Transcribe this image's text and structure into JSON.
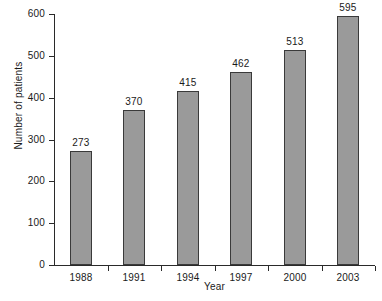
{
  "chart_data": {
    "type": "bar",
    "title": "",
    "xlabel": "Year",
    "ylabel": "Number of patients",
    "categories": [
      "1988",
      "1991",
      "1994",
      "1997",
      "2000",
      "2003"
    ],
    "values": [
      273,
      370,
      415,
      462,
      513,
      595
    ],
    "value_labels": [
      "273",
      "370",
      "415",
      "462",
      "513",
      "595"
    ],
    "ylim": [
      0,
      600
    ],
    "ytick_labels": [
      "0",
      "100",
      "200",
      "300",
      "400",
      "500",
      "600"
    ],
    "ytick_values": [
      0,
      100,
      200,
      300,
      400,
      500,
      600
    ],
    "grid": false,
    "legend": false,
    "legend_position": "none",
    "series": [
      {
        "name": "Number of patients",
        "values": [
          273,
          370,
          415,
          462,
          513,
          595
        ],
        "fill_color": "#9a9a9a",
        "edge_color": "#3a3a3a"
      }
    ]
  },
  "colors": {
    "background": "#ffffff",
    "axis": "#2a2a2a",
    "text": "#1a1a1a",
    "bar_fill": "#9a9a9a",
    "bar_edge": "#3a3a3a"
  }
}
